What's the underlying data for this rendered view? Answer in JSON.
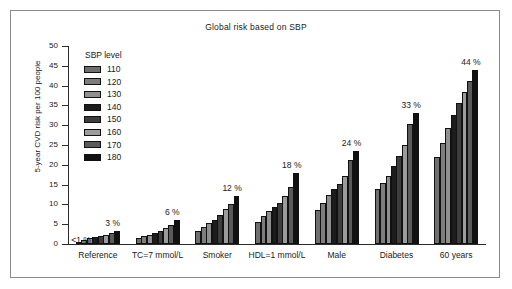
{
  "figure": {
    "title": "Global risk based on SBP"
  },
  "legend": {
    "title": "SBP level",
    "position": "inside-top-left",
    "entries": [
      {
        "label": "110",
        "color": "#6e6e6e"
      },
      {
        "label": "120",
        "color": "#7d7d7d"
      },
      {
        "label": "130",
        "color": "#8f8f8f"
      },
      {
        "label": "140",
        "color": "#1c1c1c"
      },
      {
        "label": "150",
        "color": "#3d3d3d"
      },
      {
        "label": "160",
        "color": "#9b9b9b"
      },
      {
        "label": "170",
        "color": "#5a5a5a"
      },
      {
        "label": "180",
        "color": "#111111"
      }
    ]
  },
  "axes": {
    "ylabel": "5-year CVD risk per 100 people",
    "xlabel": "",
    "yticks": [
      0,
      5,
      10,
      15,
      20,
      25,
      30,
      35,
      40,
      45,
      50
    ],
    "ylim": [
      0,
      50
    ],
    "grid": false
  },
  "chart_data": {
    "type": "bar",
    "title": "Global risk based on SBP",
    "xlabel": "",
    "ylabel": "5-year CVD risk per 100 people",
    "ylim": [
      0,
      50
    ],
    "grid": false,
    "legend_title": "SBP level",
    "legend_position": "inside-top-left",
    "categories": [
      "Reference",
      "TC=7 mmol/L",
      "Smoker",
      "HDL=1 mmol/L",
      "Male",
      "Diabetes",
      "60 years"
    ],
    "series": [
      {
        "name": "110",
        "values": [
          0.4,
          1.4,
          3.3,
          5.6,
          8.7,
          14.0,
          21.9
        ]
      },
      {
        "name": "120",
        "values": [
          1.1,
          2.0,
          4.4,
          7.2,
          10.3,
          15.3,
          25.5
        ]
      },
      {
        "name": "130",
        "values": [
          1.5,
          2.4,
          5.2,
          8.4,
          12.4,
          17.2,
          29.4
        ]
      },
      {
        "name": "140",
        "values": [
          1.8,
          2.9,
          6.1,
          9.4,
          13.8,
          19.6,
          32.5
        ]
      },
      {
        "name": "150",
        "values": [
          2.0,
          3.4,
          7.3,
          10.3,
          15.2,
          22.2,
          35.6
        ]
      },
      {
        "name": "160",
        "values": [
          2.2,
          4.0,
          8.9,
          12.2,
          17.3,
          25.1,
          38.5
        ]
      },
      {
        "name": "170",
        "values": [
          2.8,
          4.8,
          10.2,
          14.5,
          21.3,
          30.2,
          41.1
        ]
      },
      {
        "name": "180",
        "values": [
          3.3,
          6.0,
          12.1,
          17.9,
          23.5,
          33.0,
          44.0
        ]
      }
    ],
    "annotations": [
      {
        "text": "<1 %",
        "category": "Reference",
        "side": "left"
      },
      {
        "text": "3 %",
        "category": "Reference",
        "side": "right"
      },
      {
        "text": "6 %",
        "category": "TC=7 mmol/L",
        "side": "right"
      },
      {
        "text": "12 %",
        "category": "Smoker",
        "side": "right"
      },
      {
        "text": "18 %",
        "category": "HDL=1 mmol/L",
        "side": "right"
      },
      {
        "text": "24 %",
        "category": "Male",
        "side": "right"
      },
      {
        "text": "33 %",
        "category": "Diabetes",
        "side": "right"
      },
      {
        "text": "44 %",
        "category": "60 years",
        "side": "right"
      }
    ]
  }
}
